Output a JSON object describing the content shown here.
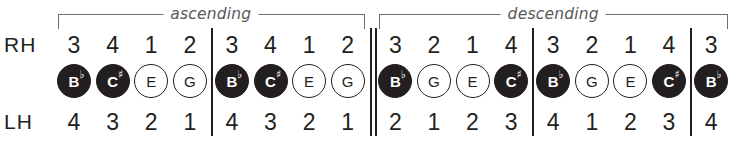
{
  "diagram": {
    "row_labels": {
      "right_hand": "RH",
      "left_hand": "LH"
    },
    "brackets": [
      {
        "label": "ascending",
        "start_col": 0,
        "end_col": 7
      },
      {
        "label": "descending",
        "start_col": 8,
        "end_col": 16
      }
    ],
    "colors": {
      "ink": "#231f20",
      "bracket": "#6d6e71",
      "label": "#58595b",
      "background": "#ffffff",
      "note_filled": "#231f20",
      "note_open": "#ffffff"
    },
    "columns": [
      {
        "rh": "3",
        "lh": "4",
        "note": "B",
        "accidental": "♭",
        "fill": "filled",
        "bar_after": false
      },
      {
        "rh": "4",
        "lh": "3",
        "note": "C",
        "accidental": "♯",
        "fill": "filled",
        "bar_after": false
      },
      {
        "rh": "1",
        "lh": "2",
        "note": "E",
        "accidental": "",
        "fill": "open",
        "bar_after": false
      },
      {
        "rh": "2",
        "lh": "1",
        "note": "G",
        "accidental": "",
        "fill": "open",
        "bar_after": true
      },
      {
        "rh": "3",
        "lh": "4",
        "note": "B",
        "accidental": "♭",
        "fill": "filled",
        "bar_after": false
      },
      {
        "rh": "4",
        "lh": "3",
        "note": "C",
        "accidental": "♯",
        "fill": "filled",
        "bar_after": false
      },
      {
        "rh": "1",
        "lh": "2",
        "note": "E",
        "accidental": "",
        "fill": "open",
        "bar_after": false
      },
      {
        "rh": "2",
        "lh": "1",
        "note": "G",
        "accidental": "",
        "fill": "open",
        "bar_after": "double"
      },
      {
        "rh": "3",
        "lh": "2",
        "note": "B",
        "accidental": "♭",
        "fill": "filled",
        "bar_after": false
      },
      {
        "rh": "2",
        "lh": "1",
        "note": "G",
        "accidental": "",
        "fill": "open",
        "bar_after": false
      },
      {
        "rh": "1",
        "lh": "2",
        "note": "E",
        "accidental": "",
        "fill": "open",
        "bar_after": false
      },
      {
        "rh": "4",
        "lh": "3",
        "note": "C",
        "accidental": "♯",
        "fill": "filled",
        "bar_after": true
      },
      {
        "rh": "3",
        "lh": "4",
        "note": "B",
        "accidental": "♭",
        "fill": "filled",
        "bar_after": false
      },
      {
        "rh": "2",
        "lh": "1",
        "note": "G",
        "accidental": "",
        "fill": "open",
        "bar_after": false
      },
      {
        "rh": "1",
        "lh": "2",
        "note": "E",
        "accidental": "",
        "fill": "open",
        "bar_after": false
      },
      {
        "rh": "4",
        "lh": "3",
        "note": "C",
        "accidental": "♯",
        "fill": "filled",
        "bar_after": true
      },
      {
        "rh": "3",
        "lh": "4",
        "note": "B",
        "accidental": "♭",
        "fill": "filled",
        "bar_after": false
      }
    ]
  }
}
